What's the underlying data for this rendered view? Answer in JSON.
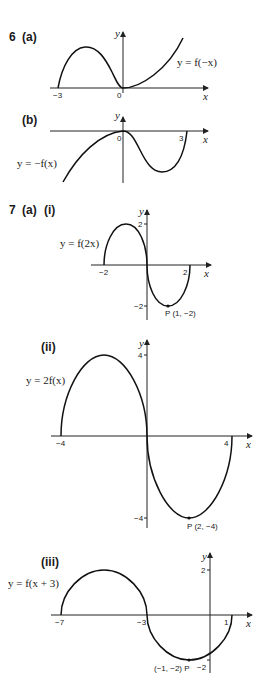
{
  "questions": [
    {
      "id": "6a",
      "number_label": "6",
      "part_label": "(a)",
      "equation": "y = f(−x)",
      "x_axis_label": "x",
      "y_axis_label": "y",
      "x_ticks": [
        "−3",
        "0"
      ],
      "y_ticks": [],
      "points": []
    },
    {
      "id": "6b",
      "part_label": "(b)",
      "equation": "y = −f(x)",
      "x_axis_label": "x",
      "y_axis_label": "y",
      "x_ticks": [
        "0",
        "3"
      ],
      "y_ticks": [],
      "points": []
    },
    {
      "id": "7ai",
      "number_label": "7",
      "part_label": "(a)",
      "subpart_label": "(i)",
      "equation": "y = f(2x)",
      "x_axis_label": "x",
      "y_axis_label": "y",
      "x_ticks": [
        "−2",
        "2"
      ],
      "y_ticks": [
        "2",
        "−2"
      ],
      "points": [
        {
          "label": "P (1, −2)",
          "x": 1,
          "y": -2
        }
      ]
    },
    {
      "id": "7aii",
      "subpart_label": "(ii)",
      "equation": "y = 2f(x)",
      "x_axis_label": "x",
      "y_axis_label": "y",
      "x_ticks": [
        "−4",
        "4"
      ],
      "y_ticks": [
        "4",
        "−4"
      ],
      "points": [
        {
          "label": "P (2, −4)",
          "x": 2,
          "y": -4
        }
      ]
    },
    {
      "id": "7aiii",
      "subpart_label": "(iii)",
      "equation": "y = f(x + 3)",
      "x_axis_label": "x",
      "y_axis_label": "y",
      "x_ticks": [
        "−7",
        "−3",
        "1"
      ],
      "y_ticks": [
        "2",
        "−2"
      ],
      "points": [
        {
          "label": "(−1, −2) P",
          "x": -1,
          "y": -2
        }
      ]
    }
  ]
}
